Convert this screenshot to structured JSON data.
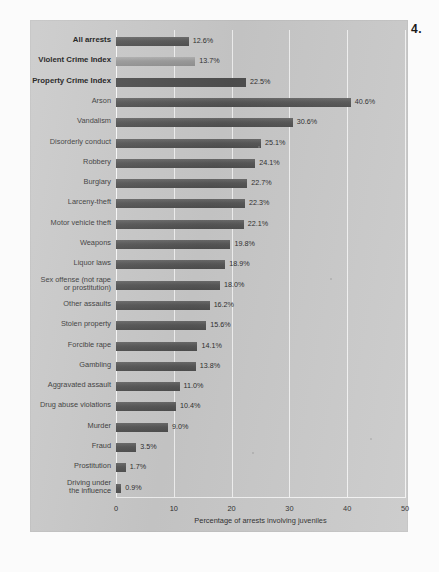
{
  "figure": {
    "number_label": "4."
  },
  "chart_data": {
    "type": "bar",
    "orientation": "horizontal",
    "title": "",
    "subtitle": "",
    "xlabel": "Percentage of arrests involving juveniles",
    "ylabel": "",
    "xlim": [
      0,
      50
    ],
    "xticks": [
      "0",
      "10",
      "20",
      "30",
      "40",
      "50"
    ],
    "grid": true,
    "legend": "none",
    "value_suffix": "%",
    "categories": [
      "All arrests",
      "Violent Crime Index",
      "Property Crime Index",
      "Arson",
      "Vandalism",
      "Disorderly conduct",
      "Robbery",
      "Burglary",
      "Larceny-theft",
      "Motor vehicle theft",
      "Weapons",
      "Liquor laws",
      "Sex offense (not rape\nor prostitution)",
      "Other assaults",
      "Stolen property",
      "Forcible rape",
      "Gambling",
      "Aggravated assault",
      "Drug abuse violations",
      "Murder",
      "Fraud",
      "Prostitution",
      "Driving under\nthe influence"
    ],
    "values": [
      12.6,
      13.7,
      22.5,
      40.6,
      30.6,
      25.1,
      24.1,
      22.7,
      22.3,
      22.1,
      19.8,
      18.9,
      18.0,
      16.2,
      15.6,
      14.1,
      13.8,
      11.0,
      10.4,
      9.0,
      3.5,
      1.7,
      0.9
    ],
    "value_labels": [
      "12.6%",
      "13.7%",
      "22.5%",
      "40.6%",
      "30.6%",
      "25.1%",
      "24.1%",
      "22.7%",
      "22.3%",
      "22.1%",
      "19.8%",
      "18.9%",
      "18.0%",
      "16.2%",
      "15.6%",
      "14.1%",
      "13.8%",
      "11.0%",
      "10.4%",
      "9.0%",
      "3.5%",
      "1.7%",
      "0.9%"
    ],
    "emphasized": [
      true,
      true,
      true,
      false,
      false,
      false,
      false,
      false,
      false,
      false,
      false,
      false,
      false,
      false,
      false,
      false,
      false,
      false,
      false,
      false,
      false,
      false,
      false
    ],
    "bar_colors": [
      "#5d5d5d",
      "#9d9d9d",
      "#4f4f4f",
      "#5d5d5d",
      "#5d5d5d",
      "#5d5d5d",
      "#5d5d5d",
      "#5d5d5d",
      "#5d5d5d",
      "#5d5d5d",
      "#5d5d5d",
      "#5d5d5d",
      "#5d5d5d",
      "#5d5d5d",
      "#5d5d5d",
      "#5d5d5d",
      "#5d5d5d",
      "#5d5d5d",
      "#5d5d5d",
      "#5d5d5d",
      "#5d5d5d",
      "#5d5d5d",
      "#5d5d5d"
    ],
    "colors": {
      "panel_background": "#c9c9c9",
      "gridline": "#f2f2f2",
      "bar_dark": "#5d5d5d",
      "bar_light": "#9d9d9d",
      "text": "#2e2e2e"
    }
  }
}
